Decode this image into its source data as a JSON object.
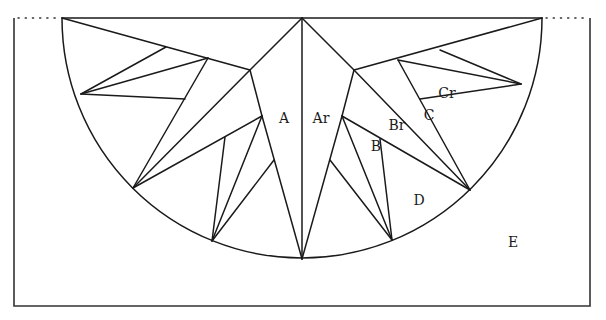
{
  "diagram": {
    "title": "",
    "colors": {
      "line": "#1a1a1a",
      "frame": "#333333",
      "background": "#ffffff"
    },
    "frame": {
      "left": 14,
      "top": 18,
      "right": 590,
      "bottom": 306
    },
    "dotted_extensions": [
      {
        "x1": 18,
        "y1": 18,
        "x2": 60,
        "y2": 18
      },
      {
        "x1": 546,
        "y1": 18,
        "x2": 588,
        "y2": 18
      }
    ],
    "half_circle": {
      "cx": 302,
      "cy": 18,
      "r": 240
    },
    "segments": [
      [
        62,
        18,
        542,
        18
      ],
      [
        302,
        18,
        302,
        259
      ],
      [
        302,
        18,
        250,
        70
      ],
      [
        250,
        70,
        262,
        116
      ],
      [
        262,
        116,
        302,
        259
      ],
      [
        62,
        18,
        250,
        70
      ],
      [
        81,
        94,
        166,
        47
      ],
      [
        81,
        94,
        208,
        58
      ],
      [
        81,
        94,
        185,
        99
      ],
      [
        208,
        58,
        133,
        188
      ],
      [
        250,
        70,
        133,
        188
      ],
      [
        133,
        188,
        262,
        116
      ],
      [
        262,
        116,
        212,
        241
      ],
      [
        225,
        137,
        212,
        241
      ],
      [
        274,
        160,
        212,
        241
      ],
      [
        302,
        18,
        354,
        70
      ],
      [
        354,
        70,
        342,
        116
      ],
      [
        342,
        116,
        302,
        259
      ],
      [
        542,
        18,
        354,
        70
      ],
      [
        521,
        84,
        440,
        50
      ],
      [
        521,
        84,
        398,
        60
      ],
      [
        521,
        84,
        420,
        99
      ],
      [
        398,
        60,
        470,
        190
      ],
      [
        354,
        70,
        470,
        190
      ],
      [
        342,
        116,
        470,
        190
      ],
      [
        342,
        116,
        392,
        240
      ],
      [
        380,
        139,
        392,
        240
      ],
      [
        330,
        160,
        392,
        240
      ]
    ],
    "labels": [
      {
        "id": "A",
        "text": "A",
        "x": 284,
        "y": 123
      },
      {
        "id": "Ar",
        "text": "Ar",
        "x": 321,
        "y": 123
      },
      {
        "id": "Br",
        "text": "Br",
        "x": 397,
        "y": 130
      },
      {
        "id": "B",
        "text": "B",
        "x": 376,
        "y": 151
      },
      {
        "id": "Cr",
        "text": "Cr",
        "x": 447,
        "y": 98
      },
      {
        "id": "C",
        "text": "C",
        "x": 429,
        "y": 120
      },
      {
        "id": "D",
        "text": "D",
        "x": 419,
        "y": 205
      },
      {
        "id": "E",
        "text": "E",
        "x": 513,
        "y": 247
      }
    ]
  }
}
